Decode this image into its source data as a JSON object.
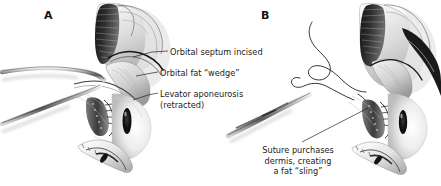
{
  "figure": {
    "type": "medical-illustration",
    "style": "grayscale pen-and-wash anatomical drawing",
    "background_color": "#ffffff",
    "ink_color": "#1b1b1b",
    "panels": [
      {
        "letter": "A",
        "side": "left",
        "callouts": [
          {
            "id": "septum",
            "text": "Orbital septum incised"
          },
          {
            "id": "fat",
            "text": "Orbital fat “wedge”"
          },
          {
            "id": "levator",
            "lines": [
              "Levator aponeurosis",
              "(retracted)"
            ]
          }
        ]
      },
      {
        "letter": "B",
        "side": "right",
        "caption": {
          "id": "suture",
          "lines": [
            "Suture purchases",
            "dermis, creating",
            "a fat “sling”"
          ]
        }
      }
    ]
  },
  "labels": {
    "panel_a_letter": "A",
    "panel_b_letter": "B",
    "orbital_septum": "Orbital septum incised",
    "orbital_fat": "Orbital fat “wedge”",
    "levator_line1": "Levator aponeurosis",
    "levator_line2": "(retracted)",
    "suture_line1": "Suture purchases",
    "suture_line2": "dermis, creating",
    "suture_line3": "a fat “sling”"
  }
}
